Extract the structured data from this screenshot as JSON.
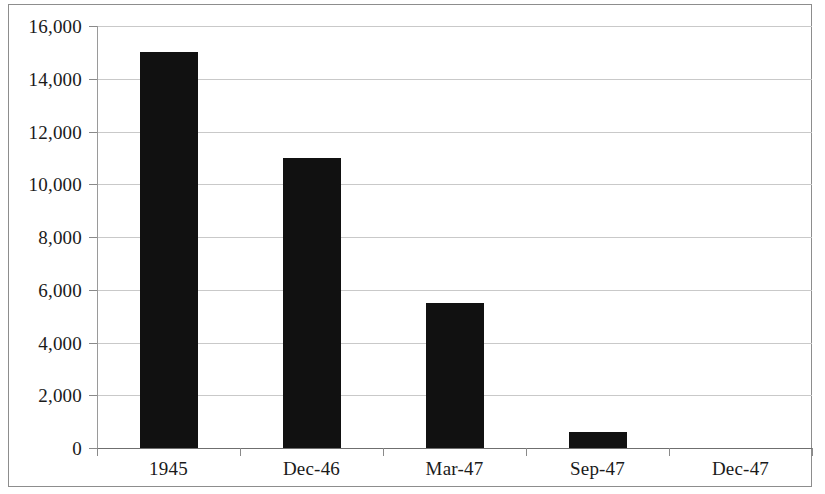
{
  "chart_data": {
    "type": "bar",
    "title": "",
    "subtitle": "",
    "xlabel": "",
    "ylabel": "",
    "categories": [
      "1945",
      "Dec-46",
      "Mar-47",
      "Sep-47",
      "Dec-47"
    ],
    "values": [
      15000,
      11000,
      5500,
      600,
      0
    ],
    "series": [
      {
        "name": "",
        "values": [
          15000,
          11000,
          5500,
          600,
          0
        ]
      }
    ],
    "ylim": [
      0,
      16000
    ],
    "ytick_values": [
      0,
      2000,
      4000,
      6000,
      8000,
      10000,
      12000,
      14000,
      16000
    ],
    "ytick_labels": [
      "0",
      "2,000",
      "4,000",
      "6,000",
      "8,000",
      "10,000",
      "12,000",
      "14,000",
      "16,000"
    ],
    "grid": true,
    "grid_axis": "y",
    "legend": false,
    "legend_position": "none",
    "bar_color": "#111111",
    "grid_color": "#c9c9c9",
    "axis_color": "#8a8a8a",
    "background_color": "#ffffff",
    "frame_color": "#8d8d8d",
    "annotations": []
  }
}
